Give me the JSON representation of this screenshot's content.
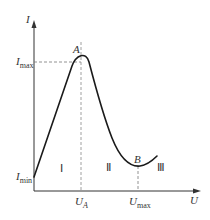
{
  "diagram": {
    "type": "I-U characteristic curve (N-shaped / negative resistance)",
    "axes": {
      "y_label": "I",
      "x_label": "U"
    },
    "y_ticks": [
      {
        "main": "I",
        "sub": "max"
      },
      {
        "main": "I",
        "sub": "min"
      }
    ],
    "x_ticks": [
      {
        "main": "U",
        "sub": "A"
      },
      {
        "main": "U",
        "sub": "max"
      }
    ],
    "points": [
      {
        "label": "A",
        "description": "peak current point at (U_A, I_max)"
      },
      {
        "label": "B",
        "description": "valley point at U_max"
      }
    ],
    "regions": [
      "Ⅰ",
      "Ⅱ",
      "Ⅲ"
    ],
    "colors": {
      "curve": "#1a1a1a",
      "axes": "#333333",
      "dashed": "#777777"
    }
  }
}
